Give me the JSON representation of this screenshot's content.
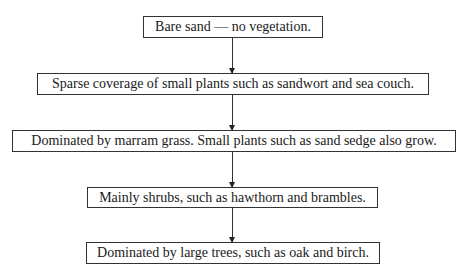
{
  "diagram": {
    "type": "flowchart",
    "stages": [
      {
        "label": "Bare sand — no vegetation."
      },
      {
        "label": "Sparse coverage of small plants such as sandwort and sea couch."
      },
      {
        "label": "Dominated by marram grass.  Small plants such as sand sedge also grow."
      },
      {
        "label": "Mainly shrubs, such as hawthorn and brambles."
      },
      {
        "label": "Dominated by large trees, such as oak and birch."
      }
    ]
  }
}
